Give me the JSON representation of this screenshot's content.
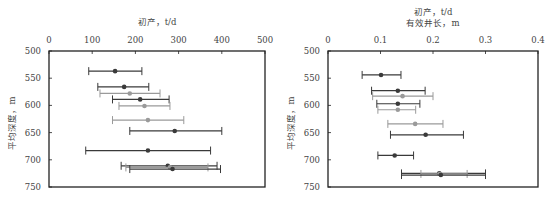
{
  "chart_data": [
    {
      "type": "errorbar-scatter",
      "title": "",
      "xlabel": "初产，t/d",
      "ylabel": "平均深度，m",
      "xlim": [
        0,
        500
      ],
      "ylim": [
        750,
        500
      ],
      "x_axis_position": "top",
      "y_inverted": true,
      "xticks": [
        "0",
        "100",
        "200",
        "300",
        "400",
        "500"
      ],
      "yticks": [
        "500",
        "550",
        "600",
        "650",
        "700",
        "750"
      ],
      "grid": false,
      "legend": null,
      "points": [
        {
          "depth": 537,
          "mean": 153,
          "low": 92,
          "high": 215,
          "shade": "dark"
        },
        {
          "depth": 566,
          "mean": 174,
          "low": 113,
          "high": 231,
          "shade": "dark"
        },
        {
          "depth": 578,
          "mean": 187,
          "low": 118,
          "high": 257,
          "shade": "light"
        },
        {
          "depth": 589,
          "mean": 211,
          "low": 147,
          "high": 278,
          "shade": "dark"
        },
        {
          "depth": 601,
          "mean": 221,
          "low": 162,
          "high": 280,
          "shade": "light"
        },
        {
          "depth": 627,
          "mean": 229,
          "low": 147,
          "high": 312,
          "shade": "light"
        },
        {
          "depth": 647,
          "mean": 291,
          "low": 187,
          "high": 400,
          "shade": "dark"
        },
        {
          "depth": 683,
          "mean": 229,
          "low": 85,
          "high": 374,
          "shade": "dark"
        },
        {
          "depth": 711,
          "mean": 275,
          "low": 167,
          "high": 389,
          "shade": "dark"
        },
        {
          "depth": 714,
          "mean": 280,
          "low": 178,
          "high": 368,
          "shade": "light"
        },
        {
          "depth": 717,
          "mean": 286,
          "low": 187,
          "high": 397,
          "shade": "dark"
        }
      ]
    },
    {
      "type": "errorbar-scatter",
      "title": "",
      "xlabel": "初产，t/d\n有效井长，m",
      "xlabel_lines": [
        "初产，t/d",
        "有效井长，m"
      ],
      "ylabel": "平均深度，m",
      "xlim": [
        0,
        0.4
      ],
      "ylim": [
        750,
        500
      ],
      "x_axis_position": "top",
      "y_inverted": true,
      "xticks": [
        "0",
        "0.1",
        "0.2",
        "0.3",
        "0.4"
      ],
      "yticks": [
        "500",
        "550",
        "600",
        "650",
        "700",
        "750"
      ],
      "grid": false,
      "legend": null,
      "points": [
        {
          "depth": 544,
          "mean": 0.101,
          "low": 0.065,
          "high": 0.139,
          "shade": "dark"
        },
        {
          "depth": 573,
          "mean": 0.133,
          "low": 0.083,
          "high": 0.185,
          "shade": "dark"
        },
        {
          "depth": 583,
          "mean": 0.142,
          "low": 0.085,
          "high": 0.2,
          "shade": "light"
        },
        {
          "depth": 597,
          "mean": 0.133,
          "low": 0.093,
          "high": 0.175,
          "shade": "dark"
        },
        {
          "depth": 608,
          "mean": 0.133,
          "low": 0.095,
          "high": 0.167,
          "shade": "light"
        },
        {
          "depth": 634,
          "mean": 0.166,
          "low": 0.114,
          "high": 0.219,
          "shade": "light"
        },
        {
          "depth": 654,
          "mean": 0.186,
          "low": 0.119,
          "high": 0.258,
          "shade": "dark"
        },
        {
          "depth": 692,
          "mean": 0.127,
          "low": 0.095,
          "high": 0.163,
          "shade": "dark"
        },
        {
          "depth": 725,
          "mean": 0.212,
          "low": 0.14,
          "high": 0.3,
          "shade": "dark"
        },
        {
          "depth": 726,
          "mean": 0.213,
          "low": 0.177,
          "high": 0.265,
          "shade": "light"
        },
        {
          "depth": 728,
          "mean": 0.215,
          "low": 0.14,
          "high": 0.3,
          "shade": "dark"
        }
      ]
    }
  ],
  "colors": {
    "dark": "#3a3a3a",
    "light": "#9a9a9a",
    "axis": "#222222"
  }
}
